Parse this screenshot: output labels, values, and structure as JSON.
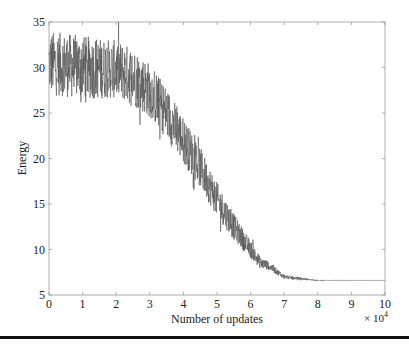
{
  "chart_data": {
    "type": "line",
    "title": "",
    "xlabel": "Number of updates",
    "ylabel": "Energy",
    "x_multiplier_label": "× 10",
    "x_multiplier_exp": "4",
    "xlim": [
      0,
      10
    ],
    "ylim": [
      5,
      35
    ],
    "xticks": [
      0,
      1,
      2,
      3,
      4,
      5,
      6,
      7,
      8,
      9,
      10
    ],
    "yticks": [
      5,
      10,
      15,
      20,
      25,
      30,
      35
    ],
    "grid": false,
    "legend": null,
    "line_color": "#555555",
    "series": [
      {
        "name": "Energy",
        "description": "Noisy energy trace vs. number of updates (x in units of 10^4)",
        "envelope": {
          "x": [
            0,
            1,
            2,
            2.5,
            3,
            3.5,
            4,
            4.5,
            5,
            5.5,
            6,
            6.3,
            6.5,
            7,
            7.5,
            8,
            9,
            10
          ],
          "mean": [
            30.5,
            30,
            29.8,
            29,
            27.5,
            25,
            22,
            19,
            15.5,
            12.5,
            10,
            8.5,
            8.3,
            7.0,
            6.8,
            6.6,
            6.6,
            6.6
          ],
          "noise": [
            2.2,
            2.2,
            2.0,
            2.0,
            1.9,
            1.8,
            1.6,
            1.4,
            1.2,
            0.9,
            0.6,
            0.4,
            0.3,
            0.15,
            0.08,
            0.03,
            0.01,
            0.0
          ]
        },
        "final_value": 6.6
      }
    ]
  }
}
